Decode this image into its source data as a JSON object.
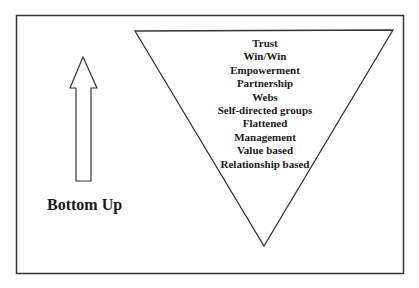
{
  "diagram": {
    "left_label": "Bottom Up",
    "triangle_items": [
      "Trust",
      "Win/Win",
      "Empowerment",
      "Partnership",
      "Webs",
      "Self-directed groups",
      "Flattened",
      "Management",
      "Value based",
      "Relationship based"
    ],
    "colors": {
      "stroke": "#333333",
      "text": "#1a1a1a",
      "background": "#ffffff"
    }
  }
}
